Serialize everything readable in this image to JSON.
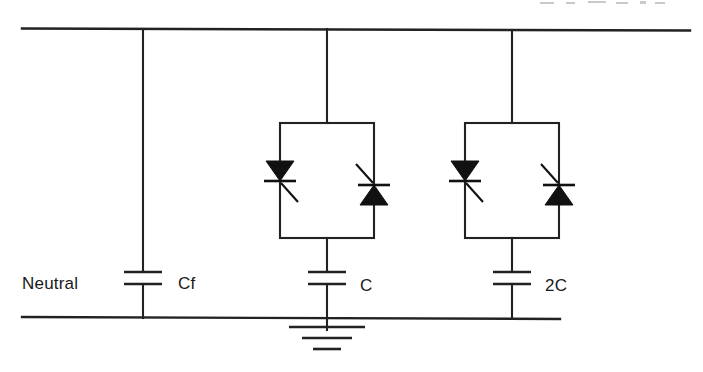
{
  "diagram": {
    "type": "electrical-schematic",
    "stroke_color": "#222222",
    "fill_color": "#111111",
    "background_color": "#ffffff",
    "labels": {
      "neutral": "Neutral",
      "cf": "Cf",
      "c": "C",
      "two_c": "2C"
    },
    "buses": {
      "top_bus": {
        "x1": 22,
        "y1": 28,
        "x2": 690,
        "y2": 30
      },
      "bottom_bus": {
        "x1": 22,
        "y1": 317,
        "x2": 560,
        "y2": 319
      }
    },
    "branches": [
      {
        "name": "fixed-filter-branch",
        "x": 143,
        "label": "Cf",
        "has_thyristors": false,
        "capacitor": {
          "plate_top_y": 272,
          "plate_bottom_y": 284,
          "plate_half_width": 19
        }
      },
      {
        "name": "tsc-branch-c",
        "x": 327,
        "label": "C",
        "has_thyristors": true,
        "box": {
          "x": 280,
          "y": 123,
          "width": 94,
          "height": 115
        },
        "capacitor": {
          "plate_top_y": 272,
          "plate_bottom_y": 284,
          "plate_half_width": 19
        }
      },
      {
        "name": "tsc-branch-2c",
        "x": 512,
        "label": "2C",
        "has_thyristors": true,
        "box": {
          "x": 465,
          "y": 123,
          "width": 94,
          "height": 115
        },
        "capacitor": {
          "plate_top_y": 272,
          "plate_bottom_y": 284,
          "plate_half_width": 19
        }
      }
    ],
    "ground": {
      "x": 327,
      "bars": [
        {
          "y": 327,
          "half_width": 38
        },
        {
          "y": 338,
          "half_width": 25
        },
        {
          "y": 349,
          "half_width": 14
        }
      ]
    },
    "thyristor_pairs": [
      {
        "name": "thyristor-pair-c",
        "left": {
          "x": 280,
          "direction": "down",
          "bar_y": 181,
          "gate": "down-right"
        },
        "right": {
          "x": 374,
          "direction": "up",
          "bar_y": 185,
          "gate": "up-left"
        }
      },
      {
        "name": "thyristor-pair-2c",
        "left": {
          "x": 465,
          "direction": "down",
          "bar_y": 181,
          "gate": "down-right"
        },
        "right": {
          "x": 559,
          "direction": "up",
          "bar_y": 185,
          "gate": "up-left"
        }
      }
    ]
  }
}
